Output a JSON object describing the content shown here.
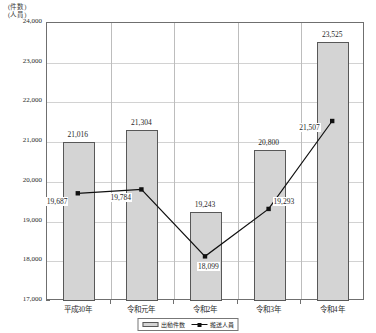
{
  "unit_caption_line1": "(件数)",
  "unit_caption_line2": "(人員)",
  "legend": {
    "bar_label": "出動件数",
    "line_label": "搬送人員"
  },
  "colors": {
    "bar_fill": "#d4d4d4",
    "bar_border": "#585858",
    "line": "#111111",
    "grid": "#d2d2d2",
    "frame": "#6f6f6f"
  },
  "chart_data": {
    "type": "bar",
    "title": "",
    "subtitle": "",
    "xlabel": "",
    "ylabel": "(件数)(人員)",
    "ylim": [
      17000,
      24000
    ],
    "ytick_step": 1000,
    "grid": true,
    "legend_position": "bottom-center",
    "categories": [
      "平成30年",
      "令和元年",
      "令和2年",
      "令和3年",
      "令和4年"
    ],
    "ytick_labels": [
      "17,000",
      "18,000",
      "19,000",
      "20,000",
      "21,000",
      "22,000",
      "23,000",
      "24,000"
    ],
    "ytick_values": [
      17000,
      18000,
      19000,
      20000,
      21000,
      22000,
      23000,
      24000
    ],
    "series": [
      {
        "name": "出動件数",
        "chart_type": "bar",
        "values": [
          21016,
          21304,
          19243,
          20800,
          23525
        ],
        "labels": [
          "21,016",
          "21,304",
          "19,243",
          "20,800",
          "23,525"
        ]
      },
      {
        "name": "搬送人員",
        "chart_type": "line",
        "values": [
          19687,
          19784,
          18099,
          19293,
          21507
        ],
        "labels": [
          "19,687",
          "19,784",
          "18,099",
          "19,293",
          "21,507"
        ]
      }
    ]
  }
}
